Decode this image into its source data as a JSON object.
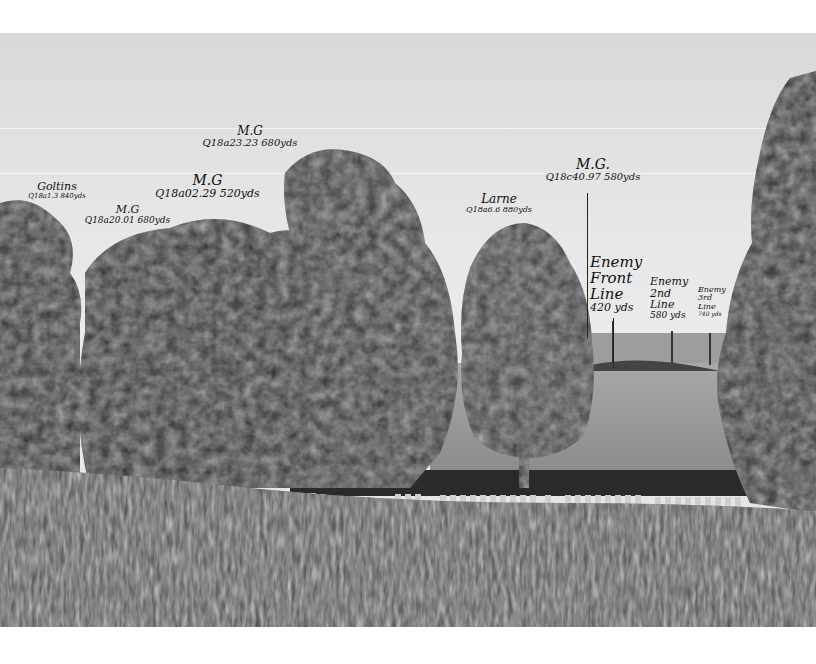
{
  "photo": {
    "description": "Black-and-white landscape photograph with handwritten trench-map annotations",
    "colors": {
      "sky": "#e6e6e6",
      "foliage_dark": "#1a1a1a",
      "foliage_mid": "#3a3a3a",
      "field": "#9a9a9a",
      "wall": "#2a2a2a",
      "headstones": "#cfcfcf",
      "crop": "#4a4a4a",
      "ink": "#111111"
    }
  },
  "annotations": [
    {
      "id": "mg-1",
      "title": "M.G",
      "coords": "Q18a23.23 680yds"
    },
    {
      "id": "mg-2",
      "title": "M.G",
      "coords": "Q18a02.29 520yds"
    },
    {
      "id": "goltins",
      "title": "Goltins",
      "coords": "Q18a1.3 840yds"
    },
    {
      "id": "mg-3",
      "title": "M.G",
      "coords": "Q18a20.01 680yds"
    },
    {
      "id": "larne",
      "title": "Larne",
      "coords": "Q18a6.6 880yds"
    },
    {
      "id": "mg-4",
      "title": "M.G.",
      "coords": "Q18c40.97 580yds"
    },
    {
      "id": "enemy-front",
      "lines": [
        "Enemy",
        "Front",
        "Line"
      ],
      "distance": "420 yds"
    },
    {
      "id": "enemy-2nd",
      "lines": [
        "Enemy",
        "2nd",
        "Line"
      ],
      "distance": "580 yds"
    },
    {
      "id": "enemy-3rd",
      "lines": [
        "Enemy",
        "3rd",
        "Line"
      ],
      "distance": "740 yds"
    }
  ]
}
